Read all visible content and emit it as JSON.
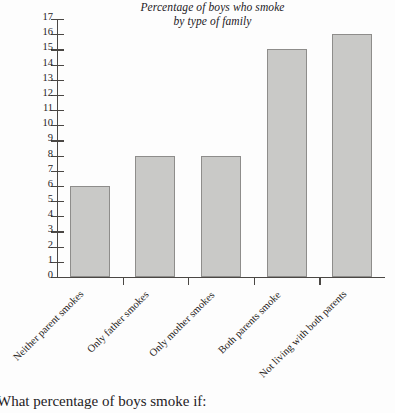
{
  "chart_data": {
    "type": "bar",
    "title": "Percentage of boys who smoke by type of family",
    "title_lines": [
      "Percentage of boys who smoke",
      "by type of family"
    ],
    "categories": [
      "Neither parent smokes",
      "Only father smokes",
      "Only mother smokes",
      "Both parents smoke",
      "Not living with both parents"
    ],
    "values": [
      6,
      8,
      8,
      15,
      16
    ],
    "xlabel": "",
    "ylabel": "",
    "ylim": [
      0,
      17
    ],
    "y_ticks": [
      0,
      1,
      2,
      3,
      4,
      5,
      6,
      7,
      8,
      9,
      10,
      11,
      12,
      13,
      14,
      15,
      16,
      17
    ],
    "y_tick_labels": [
      "0",
      "1",
      "2",
      "3",
      "4",
      "5",
      "6",
      "7",
      "8",
      "9",
      "10",
      "11",
      "12",
      "13",
      "14",
      "15",
      "16",
      "17"
    ],
    "grid": false,
    "legend": false,
    "bar_color": "#c9c9c7",
    "bar_border_color": "#8e8d8b",
    "axis_color": "#4a4744"
  },
  "caption": {
    "text": "What percentage of boys smoke if:"
  }
}
